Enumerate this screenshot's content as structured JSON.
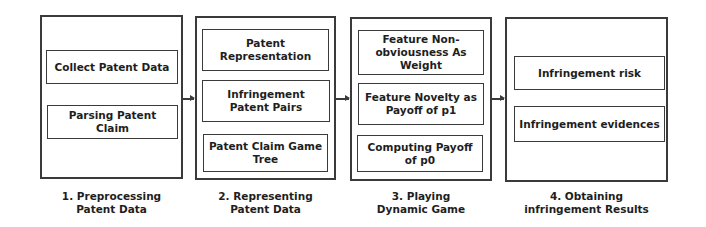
{
  "diagram": {
    "stages": [
      {
        "caption": [
          "1. Preprocessing",
          "Patent Data"
        ],
        "boxes": [
          "Collect Patent Data",
          "Parsing Patent Claim"
        ]
      },
      {
        "caption": [
          "2. Representing",
          "Patent Data"
        ],
        "boxes": [
          "Patent Representation",
          "Infringement Patent Pairs",
          "Patent Claim Game Tree"
        ]
      },
      {
        "caption": [
          "3. Playing",
          "Dynamic Game"
        ],
        "boxes": [
          "Feature Non-obviousness As Weight",
          "Feature Novelty as Payoff of p1",
          "Computing Payoff of p0"
        ]
      },
      {
        "caption": [
          "4. Obtaining",
          "infringement Results"
        ],
        "boxes": [
          "Infringement risk",
          "Infringement evidences"
        ]
      }
    ],
    "arrows": [
      "stage1-to-stage2",
      "stage2-to-stage3",
      "stage3-to-stage4"
    ]
  }
}
